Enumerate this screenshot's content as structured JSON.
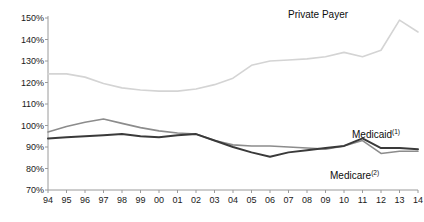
{
  "chart_data": {
    "type": "line",
    "title": "",
    "subtitle": "",
    "xlabel": "",
    "ylabel": "",
    "x": [
      "94",
      "95",
      "96",
      "97",
      "98",
      "99",
      "00",
      "01",
      "02",
      "03",
      "04",
      "05",
      "06",
      "07",
      "08",
      "09",
      "10",
      "11",
      "12",
      "13",
      "14"
    ],
    "xlim": [
      0,
      20
    ],
    "ylim": [
      70,
      150
    ],
    "y_ticks": [
      70,
      80,
      90,
      100,
      110,
      120,
      130,
      140,
      150
    ],
    "y_tick_labels": [
      "70%",
      "80%",
      "90%",
      "100%",
      "110%",
      "120%",
      "130%",
      "140%",
      "150%"
    ],
    "y_tick_suffix": "%",
    "grid": false,
    "legend_position": "inline-annotations",
    "series": [
      {
        "name": "Private Payer",
        "label": "Private Payer",
        "color": "#d4d4d4",
        "width": 1.6,
        "values": [
          124.0,
          124.0,
          122.5,
          119.5,
          117.5,
          116.5,
          116.0,
          116.0,
          117.0,
          119.0,
          122.0,
          128.0,
          130.0,
          130.5,
          131.0,
          132.0,
          134.0,
          132.0,
          135.0,
          149.0,
          143.5
        ]
      },
      {
        "name": "Medicaid",
        "label": "Medicaid",
        "label_superscript": "(1)",
        "color": "#8c8c8c",
        "width": 1.6,
        "values": [
          97.0,
          99.5,
          101.5,
          103.0,
          101.0,
          99.0,
          97.5,
          96.5,
          96.0,
          93.0,
          91.0,
          90.5,
          90.5,
          90.0,
          89.5,
          89.0,
          90.5,
          93.0,
          87.0,
          88.0,
          88.0
        ]
      },
      {
        "name": "Medicare",
        "label": "Medicare",
        "label_superscript": "(2)",
        "color": "#3a3a3a",
        "width": 2.0,
        "values": [
          94.0,
          94.5,
          95.0,
          95.5,
          96.0,
          95.0,
          94.5,
          95.5,
          96.0,
          93.0,
          90.0,
          87.5,
          85.5,
          87.5,
          88.5,
          89.5,
          90.5,
          94.0,
          89.5,
          89.5,
          89.0
        ]
      }
    ],
    "annotations": [
      {
        "text": "Private Payer",
        "series": "Private Payer"
      },
      {
        "text": "Medicaid",
        "superscript": "(1)",
        "series": "Medicaid"
      },
      {
        "text": "Medicare",
        "superscript": "(2)",
        "series": "Medicare"
      }
    ]
  },
  "axes": {
    "y_labels": [
      "150%",
      "140%",
      "130%",
      "120%",
      "110%",
      "100%",
      "90%",
      "80%",
      "70%"
    ],
    "x_labels": [
      "94",
      "95",
      "96",
      "97",
      "98",
      "99",
      "00",
      "01",
      "02",
      "03",
      "04",
      "05",
      "06",
      "07",
      "08",
      "09",
      "10",
      "11",
      "12",
      "13",
      "14"
    ]
  },
  "labels": {
    "private_payer": "Private Payer",
    "medicaid": "Medicaid",
    "medicaid_sup": "(1)",
    "medicare": "Medicare",
    "medicare_sup": "(2)"
  },
  "colors": {
    "private_payer": "#d4d4d4",
    "medicaid": "#8c8c8c",
    "medicare": "#3a3a3a",
    "axis": "#9a9a9a",
    "text": "#1a1a1a",
    "background": "#ffffff"
  }
}
